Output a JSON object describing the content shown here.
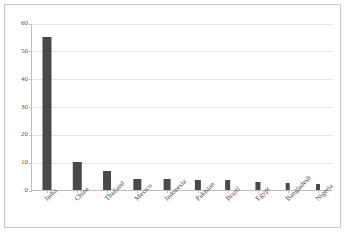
{
  "chart_data": {
    "type": "bar",
    "title": "",
    "subtitle": "",
    "xlabel": "",
    "ylabel": "",
    "categories": [
      "India",
      "China",
      "Thailand",
      "Mexico",
      "Indonesia",
      "Pakistan",
      "Brazil",
      "Egypt",
      "Bangladesh",
      "Nigeria"
    ],
    "values": [
      55,
      10,
      7,
      4,
      4,
      3.5,
      3.5,
      3,
      2.5,
      2
    ],
    "series": [
      {
        "name": "",
        "values": [
          55,
          10,
          7,
          4,
          4,
          3.5,
          3.5,
          3,
          2.5,
          2
        ]
      }
    ],
    "ylim": [
      0,
      60
    ],
    "yticks": [
      0,
      10,
      20,
      30,
      40,
      50,
      60
    ],
    "ytick_labels": [
      "0",
      "10",
      "20",
      "30",
      "40",
      "50",
      "60"
    ],
    "grid": true,
    "grid_axis": "y",
    "legend": false,
    "legend_position": "none",
    "bar_color": "#494949",
    "grid_color": "#e6e6e6",
    "axis_color": "#bfbfbf",
    "frame_color": "#c9c9c9",
    "background": "#ffffff",
    "xtick_label_rotation": -45,
    "annotations": []
  }
}
